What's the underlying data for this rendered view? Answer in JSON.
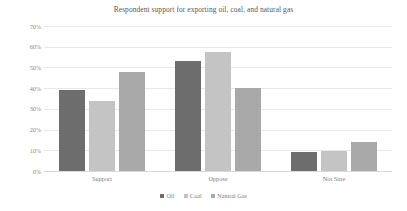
{
  "chart_data": {
    "type": "bar",
    "title": "Respondent support for exporting oil, coal, and natural gas",
    "xlabel": "",
    "ylabel": "",
    "categories": [
      "Support",
      "Oppose",
      "Not Sure"
    ],
    "series": [
      {
        "name": "Oil",
        "color": "#6d6d6d",
        "values": [
          39,
          53,
          9
        ]
      },
      {
        "name": "Coal",
        "color": "#c4c4c4",
        "values": [
          34,
          57.5,
          9.5
        ]
      },
      {
        "name": "Natural Gas",
        "color": "#a9a9a9",
        "values": [
          48,
          40,
          14
        ]
      }
    ],
    "ylim": [
      0,
      70
    ],
    "y_ticks": [
      "0%",
      "10%",
      "20%",
      "30%",
      "40%",
      "50%",
      "60%",
      "70%"
    ],
    "y_tick_values": [
      0,
      10,
      20,
      30,
      40,
      50,
      60,
      70
    ],
    "grid": "horizontal",
    "legend_position": "bottom-center"
  }
}
